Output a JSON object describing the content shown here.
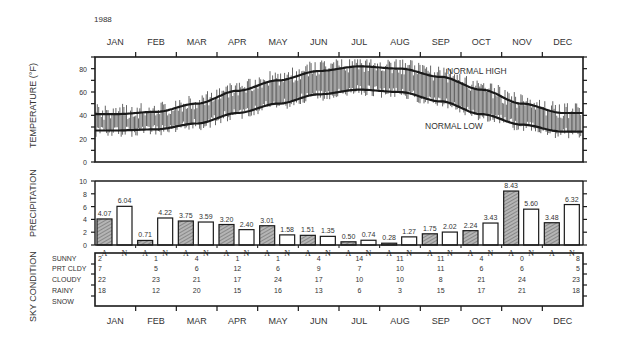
{
  "year": "1988",
  "months": [
    "JAN",
    "FEB",
    "MAR",
    "APR",
    "MAY",
    "JUN",
    "JUL",
    "AUG",
    "SEP",
    "OCT",
    "NOV",
    "DEC"
  ],
  "chart_data": [
    {
      "type": "line",
      "title": "Temperature",
      "ylabel": "TEMPERATURE (°F)",
      "ylim": [
        0,
        90
      ],
      "yticks": [
        0,
        20,
        40,
        60,
        80
      ],
      "categories": [
        "JAN",
        "FEB",
        "MAR",
        "APR",
        "MAY",
        "JUN",
        "JUL",
        "AUG",
        "SEP",
        "OCT",
        "NOV",
        "DEC"
      ],
      "series": [
        {
          "name": "NORMAL HIGH",
          "values": [
            41,
            43,
            50,
            61,
            70,
            78,
            82,
            80,
            73,
            62,
            50,
            42
          ]
        },
        {
          "name": "NORMAL LOW",
          "values": [
            27,
            28,
            33,
            42,
            50,
            58,
            62,
            60,
            52,
            41,
            32,
            26
          ]
        }
      ],
      "annotations": [
        "NORMAL HIGH",
        "NORMAL LOW"
      ],
      "daily_range_bars": true
    },
    {
      "type": "bar",
      "title": "Precipitation",
      "ylabel": "PRECIPITATION",
      "ylim": [
        0,
        10
      ],
      "yticks": [
        0,
        2,
        4,
        6,
        8,
        10
      ],
      "categories": [
        "JAN",
        "FEB",
        "MAR",
        "APR",
        "MAY",
        "JUN",
        "JUL",
        "AUG",
        "SEP",
        "OCT",
        "NOV",
        "DEC"
      ],
      "bar_labels": [
        "A",
        "N"
      ],
      "series": [
        {
          "name": "A",
          "values": [
            4.07,
            0.71,
            3.75,
            3.2,
            3.01,
            1.51,
            0.5,
            0.28,
            1.75,
            2.24,
            8.43,
            3.48
          ]
        },
        {
          "name": "N",
          "values": [
            6.04,
            4.22,
            3.59,
            2.4,
            1.58,
            1.35,
            0.74,
            1.27,
            2.02,
            3.43,
            5.6,
            6.32
          ]
        }
      ],
      "value_labels": {
        "A": [
          "4.07",
          "0.71",
          "3.75",
          "3.20",
          "3.01",
          "1.51",
          "0.50",
          "0.28",
          "1.75",
          "2.24",
          "8.43",
          "3.48"
        ],
        "N": [
          "6.04",
          "4.22",
          "3.59",
          "2.40",
          "1.58",
          "1.35",
          "0.74",
          "1.27",
          "2.02",
          "3.43",
          "5.60",
          "6.32"
        ]
      }
    },
    {
      "type": "table",
      "title": "Sky Condition",
      "ylabel": "SKY CONDITION",
      "categories": [
        "JAN",
        "FEB",
        "MAR",
        "APR",
        "MAY",
        "JUN",
        "JUL",
        "AUG",
        "SEP",
        "OCT",
        "NOV",
        "DEC"
      ],
      "rows": [
        {
          "name": "SUNNY",
          "values": [
            "2",
            "1",
            "4",
            "1",
            "1",
            "4",
            "14",
            "11",
            "11",
            "4",
            "0",
            "8"
          ]
        },
        {
          "name": "PRT CLDY",
          "values": [
            "7",
            "5",
            "6",
            "12",
            "6",
            "9",
            "7",
            "10",
            "11",
            "6",
            "6",
            "5"
          ]
        },
        {
          "name": "CLOUDY",
          "values": [
            "22",
            "23",
            "21",
            "17",
            "24",
            "17",
            "10",
            "10",
            "8",
            "21",
            "24",
            "23"
          ]
        },
        {
          "name": "RAINY",
          "values": [
            "18",
            "12",
            "20",
            "15",
            "16",
            "13",
            "6",
            "3",
            "15",
            "17",
            "21",
            "18"
          ]
        },
        {
          "name": "SNOW",
          "values": [
            "",
            "",
            "",
            "",
            "",
            "",
            "",
            "",
            "",
            "",
            "",
            ""
          ]
        }
      ]
    }
  ],
  "colors": {
    "ink": "#1a1a1a",
    "hatch": "#8a8a8a",
    "bar_fill_normal": "#ffffff",
    "daily_bar": "#555555"
  }
}
